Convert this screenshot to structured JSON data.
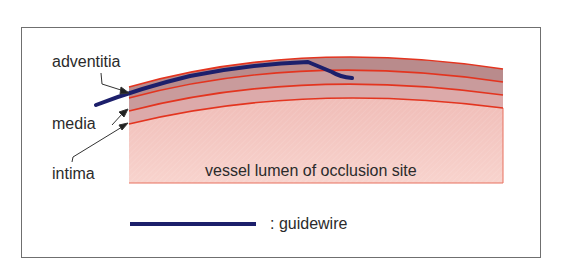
{
  "diagram": {
    "labels": {
      "adventitia": "adventitia",
      "media": "media",
      "intima": "intima",
      "lumen": "vessel lumen of occlusion site"
    },
    "legend": {
      "guidewire_label": ": guidewire"
    },
    "colors": {
      "adventitia": "#b98b8c",
      "media": "#c99b9c",
      "intima": "#dcaaaa",
      "lumen_top": "#f2c2bd",
      "lumen_bottom": "#f7cfc9",
      "boundary_lines": "#e3341f",
      "guidewire": "#1c1f6b",
      "text": "#2b2b2b",
      "frame": "#6f6f6f"
    }
  }
}
